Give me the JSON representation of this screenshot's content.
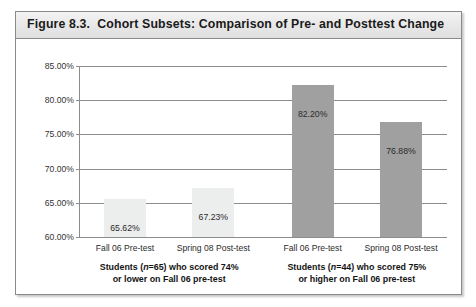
{
  "figure": {
    "title": "Figure 8.3.  Cohort Subsets: Comparison of Pre- and Posttest Change"
  },
  "chart_data": {
    "type": "bar",
    "title": "Figure 8.3.  Cohort Subsets: Comparison of Pre- and Posttest Change",
    "xlabel": "",
    "ylabel": "",
    "ylim": [
      60.0,
      85.0
    ],
    "ytick_step": 5.0,
    "ytick_labels": [
      "85.00%",
      "80.00%",
      "75.00%",
      "70.00%",
      "65.00%",
      "60.00%"
    ],
    "ytick_values": [
      85.0,
      80.0,
      75.0,
      70.0,
      65.0,
      60.0
    ],
    "grid": true,
    "legend": "none",
    "categories": [
      "Fall 06 Pre-test",
      "Spring 08 Post-test",
      "Fall 06 Pre-test",
      "Spring 08 Post-test"
    ],
    "values": [
      65.62,
      67.23,
      82.2,
      76.88
    ],
    "value_labels": [
      "65.62%",
      "67.23%",
      "82.20%",
      "76.88%"
    ],
    "bar_colors": [
      "#eceded",
      "#eceded",
      "#a0a0a0",
      "#a0a0a0"
    ],
    "groups": [
      {
        "caption_line1_pre": "Students (",
        "caption_n": "n",
        "caption_line1_post": "=65) who scored 74%",
        "caption_line2": "or lower on Fall 06 pre-test",
        "categories": [
          "Fall 06 Pre-test",
          "Spring 08 Post-test"
        ],
        "values": [
          65.62,
          67.23
        ]
      },
      {
        "caption_line1_pre": "Students (",
        "caption_n": "n",
        "caption_line1_post": "=44) who scored 75%",
        "caption_line2": "or higher on Fall 06 pre-test",
        "categories": [
          "Fall 06 Pre-test",
          "Spring 08 Post-test"
        ],
        "values": [
          82.2,
          76.88
        ]
      }
    ]
  },
  "colors": {
    "frame_border": "#8a8a8a",
    "title_band": "#e9e9e9",
    "gridline": "#8c8c8c",
    "bar_light": "#eceded",
    "bar_dark": "#a0a0a0"
  }
}
